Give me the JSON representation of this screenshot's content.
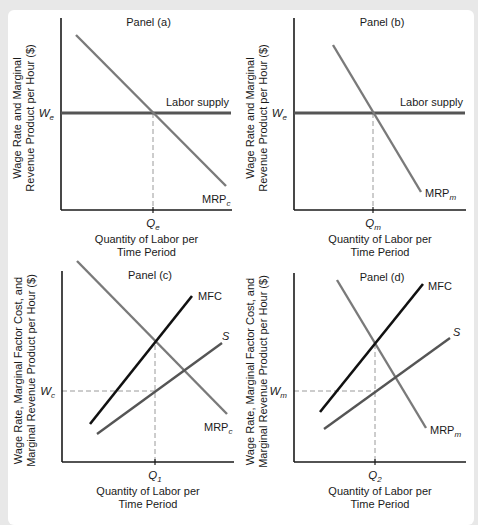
{
  "chart_data": [
    {
      "id": "a",
      "type": "line",
      "title": "Panel (a)",
      "xlabel": [
        "Quantity of Labor per",
        "Time Period"
      ],
      "ylabel": [
        "Wage Rate and Marginal",
        "Revenue Product per Hour ($)"
      ],
      "axes": {
        "origin": [
          61,
          210
        ],
        "x_end": 232,
        "y_top": 18
      },
      "series": [
        {
          "name": "Labor supply",
          "color": "#555555",
          "width": 3,
          "points": [
            [
              61,
              113
            ],
            [
              231,
              113
            ]
          ],
          "label": "Labor supply",
          "label_pos": [
            229,
            106
          ],
          "anchor": "end"
        },
        {
          "name": "MRPc",
          "color": "#7a7a7a",
          "width": 2.4,
          "points": [
            [
              76,
              35
            ],
            [
              226,
              186
            ]
          ],
          "label": "MRP",
          "label_sub": "c",
          "label_pos": [
            202,
            203
          ],
          "anchor": "start"
        }
      ],
      "guides": [
        {
          "from": [
            153,
            113
          ],
          "to": [
            153,
            210
          ]
        }
      ],
      "x_tick": {
        "label": "Q",
        "sub": "e",
        "x": 153
      },
      "y_tick": {
        "label": "W",
        "sub": "e",
        "y": 113
      }
    },
    {
      "id": "b",
      "type": "line",
      "title": "Panel (b)",
      "xlabel": [
        "Quantity of Labor per",
        "Time Period"
      ],
      "ylabel": [
        "Wage Rate and Marginal",
        "Revenue Product per Hour ($)"
      ],
      "axes": {
        "origin": [
          294,
          210
        ],
        "x_end": 466,
        "y_top": 18
      },
      "series": [
        {
          "name": "Labor supply",
          "color": "#555555",
          "width": 3,
          "points": [
            [
              294,
              113
            ],
            [
              465,
              113
            ]
          ],
          "label": "Labor supply",
          "label_pos": [
            463,
            106
          ],
          "anchor": "end"
        },
        {
          "name": "MRPm",
          "color": "#7a7a7a",
          "width": 2.4,
          "points": [
            [
              333,
              45
            ],
            [
              421,
              192
            ]
          ],
          "label": "MRP",
          "label_sub": "m",
          "label_pos": [
            425,
            197
          ],
          "anchor": "start"
        }
      ],
      "guides": [
        {
          "from": [
            373,
            113
          ],
          "to": [
            373,
            210
          ]
        }
      ],
      "x_tick": {
        "label": "Q",
        "sub": "m",
        "x": 373
      },
      "y_tick": {
        "label": "W",
        "sub": "e",
        "y": 113
      }
    },
    {
      "id": "c",
      "type": "line",
      "title": "Panel (c)",
      "xlabel": [
        "Quantity of Labor per",
        "Time Period"
      ],
      "ylabel": [
        "Wage Rate, Marginal Factor Cost, and",
        "Marginal Revenue Product per Hour ($)"
      ],
      "axes": {
        "origin": [
          62,
          462
        ],
        "x_end": 234,
        "y_top": 271
      },
      "series": [
        {
          "name": "MRPc",
          "color": "#7a7a7a",
          "width": 2.4,
          "points": [
            [
              77,
              261
            ],
            [
              227,
              414
            ]
          ],
          "label": "MRP",
          "label_sub": "c",
          "label_pos": [
            204,
            431
          ],
          "anchor": "start"
        },
        {
          "name": "MFC",
          "color": "#111111",
          "width": 2.6,
          "points": [
            [
              90,
              424
            ],
            [
              192,
              296
            ]
          ],
          "label": "MFC",
          "label_pos": [
            198,
            300
          ],
          "anchor": "start"
        },
        {
          "name": "S",
          "color": "#555555",
          "width": 2.4,
          "points": [
            [
              97,
              434
            ],
            [
              222,
              343
            ]
          ],
          "label": "S",
          "label_pos": [
            222,
            340
          ],
          "anchor": "start",
          "italic": true
        }
      ],
      "guides": [
        {
          "from": [
            155,
            345
          ],
          "to": [
            155,
            462
          ]
        },
        {
          "from": [
            62,
            391
          ],
          "to": [
            155,
            391
          ]
        }
      ],
      "x_tick": {
        "label": "Q",
        "sub": "1",
        "x": 155
      },
      "y_tick": {
        "label": "W",
        "sub": "c",
        "y": 391
      }
    },
    {
      "id": "d",
      "type": "line",
      "title": "Panel (d)",
      "xlabel": [
        "Quantity of Labor per",
        "Time Period"
      ],
      "ylabel": [
        "Wage Rate, Marginal Factor Cost, and",
        "Marginal Revenue Product per Hour ($)"
      ],
      "axes": {
        "origin": [
          294,
          462
        ],
        "x_end": 466,
        "y_top": 273
      },
      "series": [
        {
          "name": "MRPm",
          "color": "#7a7a7a",
          "width": 2.4,
          "points": [
            [
              337,
              280
            ],
            [
              426,
              428
            ]
          ],
          "label": "MRP",
          "label_sub": "m",
          "label_pos": [
            430,
            434
          ],
          "anchor": "start"
        },
        {
          "name": "MFC",
          "color": "#111111",
          "width": 2.6,
          "points": [
            [
              320,
              412
            ],
            [
              423,
              284
            ]
          ],
          "label": "MFC",
          "label_pos": [
            428,
            290
          ],
          "anchor": "start"
        },
        {
          "name": "S",
          "color": "#555555",
          "width": 2.4,
          "points": [
            [
              324,
              429
            ],
            [
              450,
              338
            ]
          ],
          "label": "S",
          "label_pos": [
            453,
            336
          ],
          "anchor": "start",
          "italic": true
        }
      ],
      "guides": [
        {
          "from": [
            375,
            344
          ],
          "to": [
            375,
            462
          ]
        },
        {
          "from": [
            294,
            391
          ],
          "to": [
            375,
            391
          ]
        }
      ],
      "x_tick": {
        "label": "Q",
        "sub": "2",
        "x": 375
      },
      "y_tick": {
        "label": "W",
        "sub": "m",
        "y": 391
      }
    }
  ],
  "style": {
    "axis_color": "#1a1a1a",
    "guide_color": "#9a9a9a",
    "background": "#e8e8e8",
    "card": "#ffffff"
  }
}
